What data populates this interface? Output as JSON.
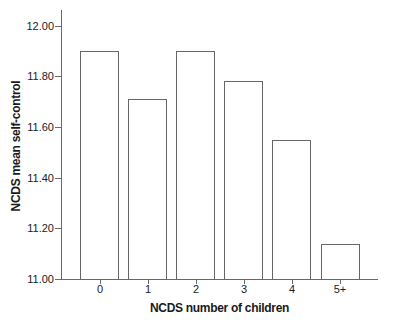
{
  "chart_data": {
    "type": "bar",
    "title": "",
    "xlabel": "NCDS number of children",
    "ylabel": "NCDS mean self-control",
    "categories": [
      "0",
      "1",
      "2",
      "3",
      "4",
      "5+"
    ],
    "values": [
      11.9,
      11.71,
      11.9,
      11.78,
      11.55,
      11.14
    ],
    "ylim": [
      11.0,
      12.0
    ],
    "yticks": [
      12.0,
      11.8,
      11.6,
      11.4,
      11.2,
      11.0
    ],
    "ytick_labels": [
      "12.00",
      "11.80",
      "11.60",
      "11.40",
      "11.20",
      "11.00"
    ],
    "grid": false,
    "legend": "none",
    "bar_fill": "#ffffff",
    "bar_stroke": "#666666",
    "axis_color": "#6a6a6a",
    "text_color": "#1a1a1a"
  }
}
